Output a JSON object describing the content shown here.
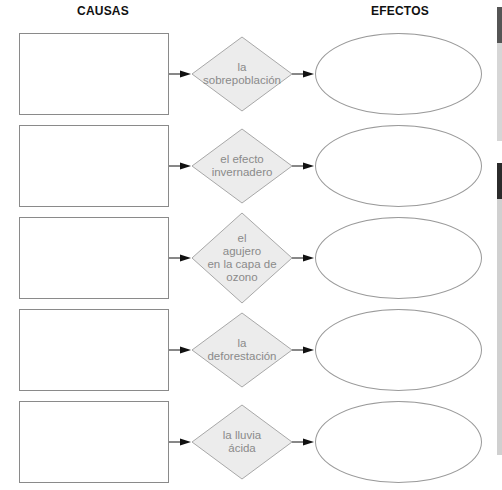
{
  "headers": {
    "causes": "CAUSAS",
    "effects": "EFECTOS"
  },
  "rows": [
    {
      "topic": "la sobrepoblación",
      "lines": [
        "la",
        "sobrepoblación"
      ],
      "cause": "",
      "effect": ""
    },
    {
      "topic": "el efecto invernadero",
      "lines": [
        "el efecto",
        "invernadero"
      ],
      "cause": "",
      "effect": ""
    },
    {
      "topic": "el agujero en la capa de ozono",
      "lines": [
        "el",
        "agujero",
        "en la capa de",
        "ozono"
      ],
      "cause": "",
      "effect": ""
    },
    {
      "topic": "la deforestación",
      "lines": [
        "la",
        "deforestación"
      ],
      "cause": "",
      "effect": ""
    },
    {
      "topic": "la lluvia ácida",
      "lines": [
        "la lluvia",
        "ácida"
      ],
      "cause": "",
      "effect": ""
    }
  ],
  "colors": {
    "diamond_fill": "#ececec",
    "diamond_stroke": "#a8a8a8",
    "text": "#8a8a8a",
    "box_stroke": "#8a8a8a",
    "arrow": "#111111"
  }
}
